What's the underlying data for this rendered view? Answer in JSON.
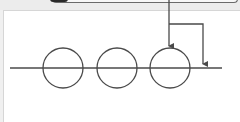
{
  "diagram": {
    "type": "circles-on-line-with-arrows",
    "baseline": {
      "x1": 10,
      "x2": 222,
      "y": 68
    },
    "circles": [
      {
        "cx": 63,
        "cy": 68,
        "r": 20
      },
      {
        "cx": 117,
        "cy": 68,
        "r": 20
      },
      {
        "cx": 170,
        "cy": 68,
        "r": 20
      }
    ],
    "arrows": [
      {
        "name": "arrow-to-circle",
        "points": "169,0 169,46"
      },
      {
        "name": "arrow-to-line",
        "points": "169,24 203,24 203,64"
      }
    ],
    "colors": {
      "stroke": "#4a4a4a",
      "background": "#ffffff",
      "frame": "#ececec"
    }
  }
}
